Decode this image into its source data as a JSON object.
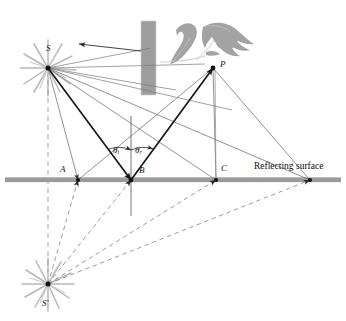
{
  "figure": {
    "width": 346,
    "height": 321,
    "background": "#ffffff",
    "colors": {
      "surface_gray": "#9a9a9a",
      "barrier_gray": "#9d9d9d",
      "eye_gray": "#a0a0a0",
      "starburst_gray": "#b5b5b5",
      "ray_bold": "#171717",
      "ray_thin": "#6e6e6e",
      "dashed_gray": "#8a8a8a",
      "normal_gray": "#8f8f8f",
      "label_ink": "#141414"
    }
  },
  "labels": {
    "source": "S",
    "image_source": "S'",
    "point_p": "P",
    "point_a": "A",
    "point_b": "B",
    "point_c": "C",
    "theta_i_symbol": "θ",
    "theta_i_sub": "i",
    "theta_r_symbol": "θ",
    "theta_r_sub": "r",
    "reflecting_surface": "Reflecting surface"
  },
  "geometry": {
    "source_point": {
      "x": 48,
      "y": 68
    },
    "image_point": {
      "x": 48,
      "y": 284
    },
    "eye_point": {
      "x": 213,
      "y": 68
    },
    "surface_y": 180,
    "surface_x_start": 5,
    "surface_x_end": 341,
    "reflection_points": [
      {
        "name": "A",
        "x": 78,
        "y": 180
      },
      {
        "name": "B",
        "x": 131,
        "y": 180
      },
      {
        "name": "C",
        "x": 216,
        "y": 180
      },
      {
        "name": "D",
        "x": 310,
        "y": 180
      }
    ],
    "normal_line": {
      "x": 131,
      "y_top": 116,
      "y_bottom": 216
    },
    "barrier_rect": {
      "x": 141,
      "y": 21,
      "width": 15,
      "height": 74
    },
    "angle_arc_radius": 30
  },
  "elements": {
    "barrier": "opaque-barrier",
    "eye": "observer-eye",
    "starburst_source": "light-source-starburst",
    "starburst_image": "virtual-image-starburst",
    "blocked_ray_arrow": "blocked-ray-arrow"
  }
}
